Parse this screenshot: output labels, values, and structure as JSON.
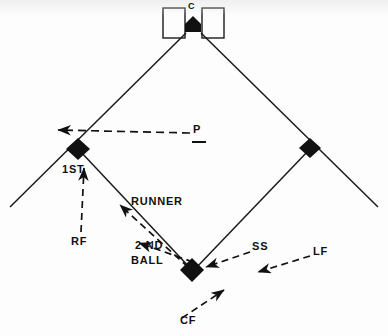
{
  "diagram": {
    "background_color": "#fdfdfd",
    "ink_color": "#111111",
    "labels": {
      "catcher": "C",
      "pitcher": "P",
      "first_base": "1ST",
      "second_base": "2 ND",
      "runner": "RUNNER",
      "ball": "BALL",
      "right_field": "RF",
      "shortstop": "SS",
      "left_field": "LF",
      "center_field": "CF"
    },
    "bases": [
      {
        "name": "home-plate",
        "shape": "pentagon",
        "x": 193,
        "y": 26,
        "filled": true
      },
      {
        "name": "first-base",
        "shape": "diamond",
        "x": 78,
        "y": 149,
        "filled": true
      },
      {
        "name": "third-base",
        "shape": "diamond",
        "x": 310,
        "y": 148,
        "filled": true
      },
      {
        "name": "second-base",
        "shape": "diamond",
        "x": 192,
        "y": 270,
        "filled": true
      }
    ],
    "batters_boxes": [
      {
        "name": "left-batters-box",
        "x": 163,
        "y": 8,
        "width": 22,
        "height": 30
      },
      {
        "name": "right-batters-box",
        "x": 202,
        "y": 8,
        "width": 22,
        "height": 30
      }
    ],
    "movement_arrows": [
      {
        "name": "pitcher-throw",
        "from": "P",
        "to": "first-base",
        "style": "dashed",
        "direction": "left"
      },
      {
        "name": "runner-path",
        "from": "second-base",
        "to": "first-base",
        "style": "dashed",
        "direction": "up-left"
      },
      {
        "name": "ball-path",
        "from": "second-base",
        "to": "first-base",
        "style": "dashed",
        "direction": "up-left"
      },
      {
        "name": "right-fielder-move",
        "from": "RF",
        "to": "first-base",
        "style": "dashed",
        "direction": "up"
      },
      {
        "name": "shortstop-move",
        "from": "SS",
        "to": "second-base",
        "style": "dashed",
        "direction": "left"
      },
      {
        "name": "left-fielder-move",
        "from": "LF",
        "to": "second-base",
        "style": "dashed",
        "direction": "left"
      },
      {
        "name": "center-fielder-move",
        "from": "CF",
        "to": "second-base",
        "style": "dashed",
        "direction": "up-right"
      }
    ]
  }
}
